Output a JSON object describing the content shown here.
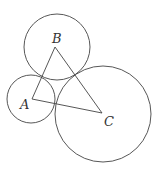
{
  "diagram": {
    "stroke_color": "#444444",
    "vertices": [
      {
        "name": "A",
        "label": "A",
        "x": 32,
        "y": 99
      },
      {
        "name": "B",
        "label": "B",
        "x": 55,
        "y": 47
      },
      {
        "name": "C",
        "label": "C",
        "x": 102,
        "y": 113
      }
    ],
    "circles": [
      {
        "center": "A",
        "cx": 31,
        "cy": 99,
        "r": 24
      },
      {
        "center": "B",
        "cx": 57,
        "cy": 47,
        "r": 33
      },
      {
        "center": "C",
        "cx": 103,
        "cy": 114,
        "r": 48
      }
    ]
  }
}
